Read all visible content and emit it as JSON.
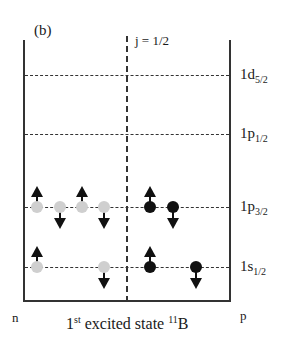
{
  "panel_label": "(b)",
  "j_label": "j = 1/2",
  "levels": [
    {
      "name": "1d",
      "sub": "5/2",
      "y": 75
    },
    {
      "name": "1p",
      "sub": "1/2",
      "y": 134
    },
    {
      "name": "1p",
      "sub": "3/2",
      "y": 207
    },
    {
      "name": "1s",
      "sub": "1/2",
      "y": 267
    }
  ],
  "axis": {
    "left": "n",
    "right": "p"
  },
  "caption": {
    "prefix": "1",
    "sup": "st",
    "middle": " excited state ",
    "iso_sup": "11",
    "element": "B"
  },
  "nucleons": {
    "neutron_color": "#cfcfcf",
    "proton_color": "#111111",
    "neutrons": [
      {
        "level": "1p3/2",
        "x": 37,
        "y": 207,
        "spin": "up"
      },
      {
        "level": "1p3/2",
        "x": 60,
        "y": 207,
        "spin": "down"
      },
      {
        "level": "1p3/2",
        "x": 82,
        "y": 207,
        "spin": "up"
      },
      {
        "level": "1p3/2",
        "x": 104,
        "y": 207,
        "spin": "down"
      },
      {
        "level": "1s1/2",
        "x": 37,
        "y": 267,
        "spin": "up"
      },
      {
        "level": "1s1/2",
        "x": 104,
        "y": 267,
        "spin": "down"
      }
    ],
    "protons": [
      {
        "level": "1p3/2",
        "x": 150,
        "y": 207,
        "spin": "up"
      },
      {
        "level": "1p3/2",
        "x": 173,
        "y": 207,
        "spin": "down"
      },
      {
        "level": "1s1/2",
        "x": 150,
        "y": 267,
        "spin": "up"
      },
      {
        "level": "1s1/2",
        "x": 196,
        "y": 267,
        "spin": "down"
      }
    ]
  }
}
